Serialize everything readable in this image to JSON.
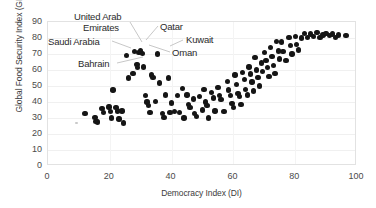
{
  "chart_data": {
    "type": "scatter",
    "title": "",
    "xlabel": "Democracy Index (DI)",
    "ylabel": "Global Food Security Index (GFSI)",
    "xlim": [
      0,
      100
    ],
    "ylim": [
      0,
      90
    ],
    "xticks": [
      0,
      20,
      40,
      60,
      80,
      100
    ],
    "yticks": [
      0,
      10,
      20,
      30,
      40,
      50,
      60,
      70,
      80,
      90
    ],
    "grid": true,
    "legend": "none",
    "marker_color": "#151515",
    "series": [
      {
        "name": "Countries",
        "points": [
          [
            12.0,
            33.0
          ],
          [
            15.2,
            30.5
          ],
          [
            15.5,
            28.0
          ],
          [
            16.0,
            27.5
          ],
          [
            17.5,
            36.0
          ],
          [
            18.0,
            33.5
          ],
          [
            19.8,
            37.0
          ],
          [
            20.2,
            34.0
          ],
          [
            20.5,
            30.0
          ],
          [
            21.0,
            47.5
          ],
          [
            22.0,
            36.5
          ],
          [
            22.4,
            34.5
          ],
          [
            23.0,
            29.5
          ],
          [
            24.0,
            34.5
          ],
          [
            24.5,
            27.0
          ],
          [
            25.5,
            69.0
          ],
          [
            26.0,
            55.0
          ],
          [
            27.5,
            58.0
          ],
          [
            28.0,
            71.5
          ],
          [
            28.8,
            63.5
          ],
          [
            29.0,
            61.5
          ],
          [
            29.5,
            71.0
          ],
          [
            30.0,
            72.0
          ],
          [
            30.5,
            70.5
          ],
          [
            31.0,
            62.0
          ],
          [
            31.5,
            44.0
          ],
          [
            32.0,
            40.0
          ],
          [
            32.5,
            38.0
          ],
          [
            33.0,
            33.5
          ],
          [
            33.5,
            57.0
          ],
          [
            34.0,
            55.5
          ],
          [
            34.8,
            40.5
          ],
          [
            35.5,
            70.0
          ],
          [
            36.0,
            52.0
          ],
          [
            37.0,
            33.0
          ],
          [
            37.5,
            30.5
          ],
          [
            38.0,
            44.5
          ],
          [
            39.0,
            55.0
          ],
          [
            39.5,
            33.5
          ],
          [
            40.0,
            39.5
          ],
          [
            41.0,
            34.0
          ],
          [
            42.0,
            44.0
          ],
          [
            42.5,
            33.5
          ],
          [
            43.5,
            48.5
          ],
          [
            44.0,
            30.0
          ],
          [
            45.0,
            44.5
          ],
          [
            45.5,
            38.5
          ],
          [
            46.0,
            36.5
          ],
          [
            47.0,
            42.0
          ],
          [
            47.5,
            33.0
          ],
          [
            48.0,
            31.0
          ],
          [
            49.0,
            43.5
          ],
          [
            50.0,
            35.0
          ],
          [
            50.5,
            48.0
          ],
          [
            51.0,
            40.0
          ],
          [
            51.5,
            38.0
          ],
          [
            52.0,
            30.0
          ],
          [
            53.0,
            46.0
          ],
          [
            53.5,
            42.5
          ],
          [
            54.0,
            34.5
          ],
          [
            55.0,
            49.0
          ],
          [
            55.5,
            44.0
          ],
          [
            56.0,
            41.5
          ],
          [
            57.0,
            34.0
          ],
          [
            58.0,
            53.0
          ],
          [
            58.5,
            47.5
          ],
          [
            59.0,
            44.0
          ],
          [
            59.5,
            39.0
          ],
          [
            60.0,
            36.5
          ],
          [
            60.5,
            57.0
          ],
          [
            61.0,
            51.0
          ],
          [
            61.5,
            45.5
          ],
          [
            62.0,
            43.5
          ],
          [
            62.5,
            38.5
          ],
          [
            63.0,
            58.5
          ],
          [
            63.5,
            54.0
          ],
          [
            64.0,
            48.0
          ],
          [
            64.5,
            44.5
          ],
          [
            65.0,
            62.0
          ],
          [
            65.5,
            57.5
          ],
          [
            66.0,
            52.5
          ],
          [
            66.5,
            47.0
          ],
          [
            67.0,
            68.0
          ],
          [
            67.5,
            60.0
          ],
          [
            68.0,
            55.5
          ],
          [
            68.5,
            50.0
          ],
          [
            69.0,
            64.5
          ],
          [
            69.5,
            59.0
          ],
          [
            70.0,
            71.0
          ],
          [
            70.5,
            66.0
          ],
          [
            71.0,
            61.5
          ],
          [
            71.5,
            56.0
          ],
          [
            72.0,
            74.0
          ],
          [
            72.5,
            68.5
          ],
          [
            73.0,
            63.0
          ],
          [
            73.5,
            58.0
          ],
          [
            74.0,
            78.0
          ],
          [
            74.5,
            72.0
          ],
          [
            75.0,
            67.0
          ],
          [
            75.5,
            77.5
          ],
          [
            76.0,
            71.5
          ],
          [
            77.0,
            66.0
          ],
          [
            78.0,
            80.5
          ],
          [
            78.5,
            75.5
          ],
          [
            79.0,
            70.0
          ],
          [
            80.0,
            81.0
          ],
          [
            80.5,
            76.0
          ],
          [
            81.0,
            72.5
          ],
          [
            82.0,
            80.0
          ],
          [
            83.0,
            83.0
          ],
          [
            84.0,
            80.5
          ],
          [
            85.0,
            82.5
          ],
          [
            86.0,
            81.0
          ],
          [
            87.0,
            83.5
          ],
          [
            88.0,
            80.5
          ],
          [
            89.0,
            82.0
          ],
          [
            90.0,
            83.0
          ],
          [
            91.0,
            81.5
          ],
          [
            92.0,
            82.5
          ],
          [
            93.0,
            80.5
          ],
          [
            94.0,
            82.0
          ],
          [
            96.5,
            81.5
          ]
        ]
      }
    ],
    "annotations": [
      {
        "label": "United Arab\nEmirates",
        "line1": "United Arab",
        "line2": "Emirates",
        "target": [
          30.0,
          72.0
        ]
      },
      {
        "label": "Saudi Arabia",
        "target": [
          25.5,
          69.0
        ]
      },
      {
        "label": "Bahrain",
        "target": [
          28.8,
          63.5
        ]
      },
      {
        "label": "Qatar",
        "target": [
          29.5,
          71.0
        ]
      },
      {
        "label": "Kuwait",
        "target": [
          35.5,
          70.0
        ]
      },
      {
        "label": "Oman",
        "target": [
          30.5,
          70.5
        ]
      }
    ]
  }
}
